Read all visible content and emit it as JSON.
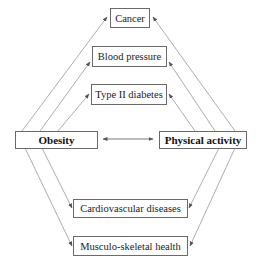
{
  "diagram": {
    "center_left": {
      "label": "Obesity"
    },
    "center_right": {
      "label": "Physical activity"
    },
    "top_outcomes": [
      {
        "label": "Cancer"
      },
      {
        "label": "Blood pressure"
      },
      {
        "label": "Type II diabetes"
      }
    ],
    "bottom_outcomes": [
      {
        "label": "Cardiovascular diseases"
      },
      {
        "label": "Musculo-skeletal health"
      }
    ],
    "relationship": "bidirectional",
    "line_color": "#777777"
  }
}
